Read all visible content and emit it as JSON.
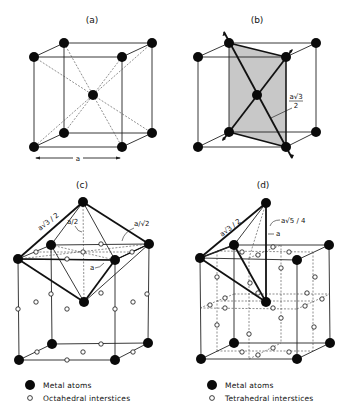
{
  "figure": {
    "panels": [
      {
        "id": "a",
        "label": "(a)",
        "dimension_label": "a"
      },
      {
        "id": "b",
        "label": "(b)",
        "dimension_label_num": "a√3",
        "dimension_label_den": "2"
      },
      {
        "id": "c",
        "label": "(c)",
        "labels": [
          "a√3 / 2",
          "a/2",
          "a/√2",
          "a"
        ]
      },
      {
        "id": "d",
        "label": "(d)",
        "labels": [
          "a√3 / 2",
          "a√5 / 4",
          "a"
        ]
      }
    ],
    "legend_c": {
      "metal": "Metal atoms",
      "site": "Octahedral interstices"
    },
    "legend_d": {
      "metal": "Metal atoms",
      "site": "Tetrahedral interstices"
    },
    "colors": {
      "atom": "#0a0a0a",
      "shade": "#c8c8c8",
      "line": "#222222"
    }
  }
}
